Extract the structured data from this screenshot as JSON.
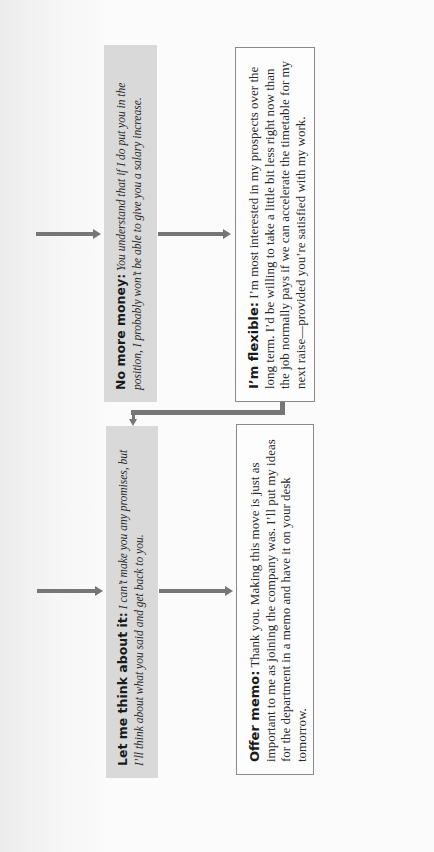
{
  "diagram": {
    "type": "flowchart",
    "orientation": "rotated-90-ccw",
    "colors": {
      "gray_box": "#d9d9d9",
      "arrow": "#767676",
      "border": "#8a8a8a"
    },
    "rows": [
      {
        "gray_box": {
          "label": "No more money:",
          "text": " You understand that if I do put you in the position, I probably won’t be able to give you a salary increase."
        },
        "white_box": {
          "label": "I’m flexible:",
          "text": " I’m most interested in my prospects over the long term. I’d be willing to take a little bit less right now than the job normally pays if we can accelerate the timetable for my next raise—provided you’re satisfied with my work."
        }
      },
      {
        "gray_box": {
          "label": "Let me think about it:",
          "text": " I can’t make you any promises, but I’ll think about what you said and get back to you."
        },
        "white_box": {
          "label": "Offer memo:",
          "text": " Thank you. Making this move is just as important to me as joining the company was. I’ll put my ideas for the department in a memo and have it on your desk tomorrow."
        }
      }
    ],
    "connectors": [
      {
        "from": "incoming",
        "to": "No more money"
      },
      {
        "from": "No more money",
        "to": "I’m flexible"
      },
      {
        "from": "I’m flexible",
        "to": "Let me think about it",
        "style": "elbow"
      },
      {
        "from": "incoming",
        "to": "Let me think about it"
      },
      {
        "from": "Let me think about it",
        "to": "Offer memo"
      }
    ]
  }
}
